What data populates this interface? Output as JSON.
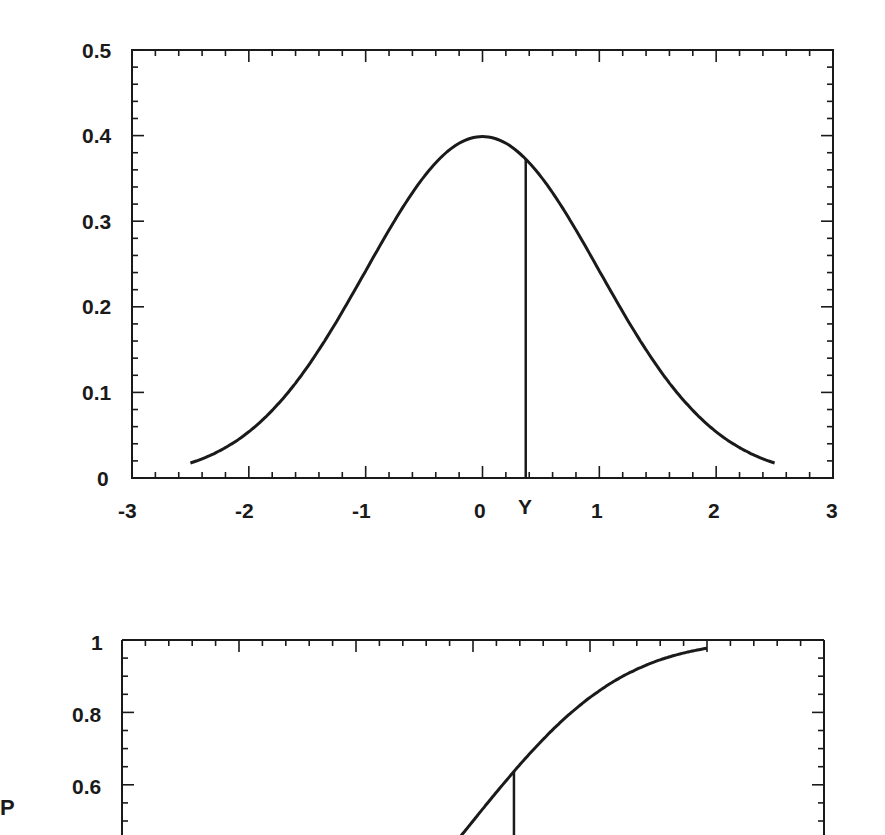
{
  "chart_data": [
    {
      "type": "line",
      "title": "",
      "description": "Standard normal probability density function with a vertical line marking Y",
      "xlabel": "",
      "ylabel": "",
      "xlim": [
        -3,
        3
      ],
      "ylim": [
        0,
        0.5
      ],
      "grid": false,
      "legend": null,
      "x_ticks": [
        "-3",
        "-2",
        "-1",
        "0",
        "1",
        "2",
        "3"
      ],
      "y_ticks": [
        "0",
        "0.1",
        "0.2",
        "0.3",
        "0.4",
        "0.5"
      ],
      "x_marker_label": "Y",
      "x_marker_value": 0.37,
      "x_marker_height": 0.372,
      "series": [
        {
          "name": "density",
          "x": [
            -2.5,
            -2.25,
            -2.0,
            -1.75,
            -1.5,
            -1.25,
            -1.0,
            -0.75,
            -0.5,
            -0.25,
            0.0,
            0.25,
            0.5,
            0.75,
            1.0,
            1.25,
            1.5,
            1.75,
            2.0,
            2.25,
            2.5
          ],
          "y": [
            0.018,
            0.032,
            0.054,
            0.086,
            0.13,
            0.183,
            0.242,
            0.301,
            0.352,
            0.387,
            0.399,
            0.387,
            0.352,
            0.301,
            0.242,
            0.183,
            0.13,
            0.086,
            0.054,
            0.032,
            0.018
          ]
        }
      ]
    },
    {
      "type": "line",
      "title": "",
      "description": "Cumulative distribution function (partially visible) with a vertical line marking Y",
      "xlabel": "",
      "ylabel": "P",
      "xlim": [
        -3,
        3
      ],
      "ylim_visible": [
        0.5,
        1
      ],
      "grid": false,
      "legend": null,
      "y_ticks": [
        "1",
        "0.8",
        "0.6"
      ],
      "x_marker_value": 0.35,
      "x_marker_height": 0.637,
      "series": [
        {
          "name": "cumulative",
          "x": [
            -0.25,
            0.0,
            0.25,
            0.5,
            0.75,
            1.0,
            1.25,
            1.5,
            1.75,
            2.0
          ],
          "y": [
            0.401,
            0.5,
            0.599,
            0.691,
            0.773,
            0.841,
            0.894,
            0.933,
            0.96,
            0.977
          ]
        }
      ]
    }
  ],
  "top_chart": {
    "y_ticks": [
      "0.5",
      "0.4",
      "0.3",
      "0.2",
      "0.1",
      "0"
    ],
    "x_ticks": [
      "-3",
      "-2",
      "-1",
      "0",
      "1",
      "2",
      "3"
    ],
    "marker_label": "Y"
  },
  "bottom_chart": {
    "y_ticks": [
      "1",
      "0.8",
      "0.6"
    ],
    "y_axis_title": "P"
  },
  "colors": {
    "ink": "#1a1a1a",
    "background": "#ffffff"
  }
}
